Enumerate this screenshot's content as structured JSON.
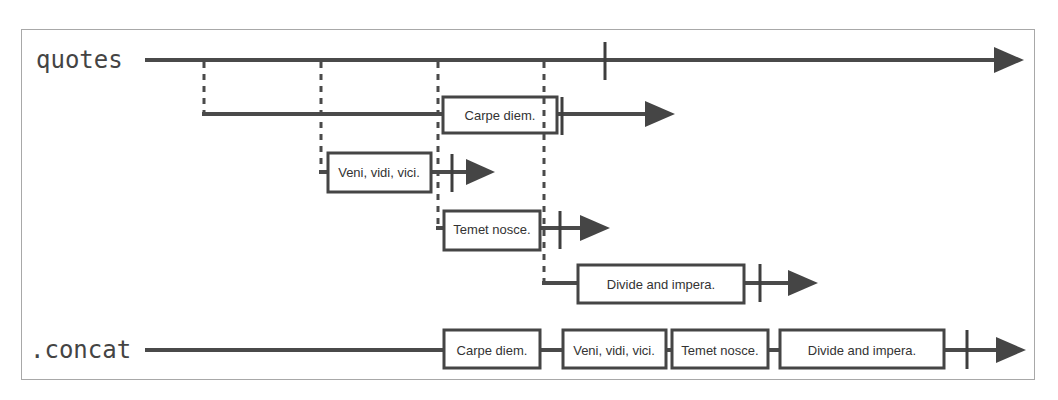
{
  "diagram": {
    "type": "marble-diagram",
    "streams": {
      "source": {
        "label": "quotes",
        "inner_observables": [
          {
            "marble": "Carpe diem."
          },
          {
            "marble": "Veni, vidi, vici."
          },
          {
            "marble": "Temet nosce."
          },
          {
            "marble": "Divide and impera."
          }
        ]
      },
      "result": {
        "label": ".concat",
        "marbles": [
          "Carpe diem.",
          "Veni, vidi, vici.",
          "Temet nosce.",
          "Divide and impera."
        ]
      }
    },
    "colors": {
      "line": "#4a4a4a",
      "frame": "#a8a8a8",
      "label": "#444444",
      "background": "#ffffff"
    }
  }
}
